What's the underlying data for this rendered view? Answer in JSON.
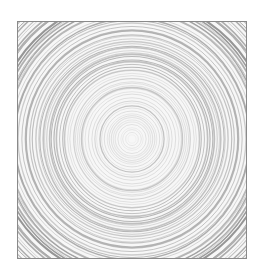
{
  "image": {
    "subject": "concentric rings pattern",
    "colors": {
      "background": "#ffffff",
      "frame_border": "#8a8a8a",
      "fill": "#f7f7f7",
      "ring_light": "#d6d6d6",
      "ring_dark": "#a8a8a8"
    },
    "center": [
      115,
      118
    ]
  }
}
